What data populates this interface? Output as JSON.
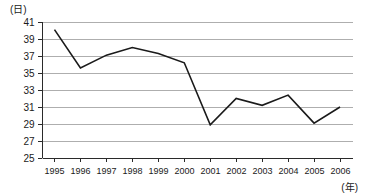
{
  "chart_data": {
    "type": "line",
    "title": "",
    "subtitle": "",
    "xlabel": "(年)",
    "ylabel": "(日)",
    "categories": [
      "1995",
      "1996",
      "1997",
      "1998",
      "1999",
      "2000",
      "2001",
      "2002",
      "2003",
      "2004",
      "2005",
      "2006"
    ],
    "values": [
      40.1,
      35.6,
      37.1,
      38.0,
      37.3,
      36.2,
      28.9,
      32.0,
      31.2,
      32.4,
      29.1,
      31.0
    ],
    "series": [
      {
        "name": "",
        "values": [
          40.1,
          35.6,
          37.1,
          38.0,
          37.3,
          36.2,
          28.9,
          32.0,
          31.2,
          32.4,
          29.1,
          31.0
        ]
      }
    ],
    "ylim": [
      25,
      41
    ],
    "ytick_labels": [
      "41",
      "39",
      "37",
      "35",
      "33",
      "31",
      "29",
      "27",
      "25"
    ],
    "ytick_values": [
      41,
      39,
      37,
      35,
      33,
      31,
      29,
      27,
      25
    ],
    "xtick_labels": [
      "1995",
      "1996",
      "1997",
      "1998",
      "1999",
      "2000",
      "2001",
      "2002",
      "2003",
      "2004",
      "2005",
      "2006"
    ],
    "grid": true,
    "grid_axis": "y",
    "legend": false,
    "legend_position": "none",
    "line_color": "#1a1a1a",
    "grid_color": "#9a9a9a",
    "axis_color": "#2a2a2a",
    "background_color": "#ffffff",
    "annotations": []
  },
  "axes": {
    "y_unit_label": "(日)",
    "x_unit_label": "(年)"
  }
}
